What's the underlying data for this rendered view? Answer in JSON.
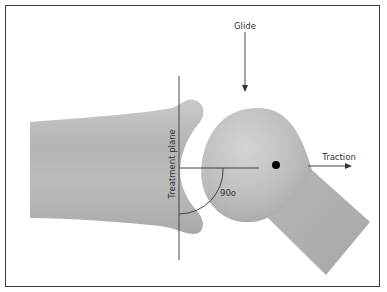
{
  "figure": {
    "type": "joint-mechanics-diagram",
    "labels": {
      "glide": "Glide",
      "traction": "Traction",
      "treatment_plane": "Treatment plane",
      "angle": "90o"
    },
    "colors": {
      "bone_fill": "#bdbdbd",
      "bone_shade": "#a9a9a9",
      "line": "#333333",
      "dot": "#000000",
      "frame": "#3a3a3a"
    }
  }
}
